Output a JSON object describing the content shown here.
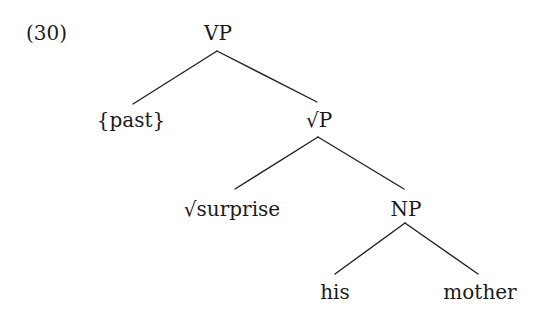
{
  "example_number": "(30)",
  "tree": {
    "nodes": [
      {
        "id": "vp",
        "label": "VP",
        "x": 218,
        "y": 23
      },
      {
        "id": "past",
        "label": "{past}",
        "x": 131,
        "y": 110
      },
      {
        "id": "rootp",
        "label": "√P",
        "x": 319,
        "y": 110
      },
      {
        "id": "surprise",
        "label": "√surprise",
        "x": 232,
        "y": 199
      },
      {
        "id": "np",
        "label": "NP",
        "x": 406,
        "y": 199
      },
      {
        "id": "his",
        "label": "his",
        "x": 335,
        "y": 282
      },
      {
        "id": "mother",
        "label": "mother",
        "x": 480,
        "y": 282
      }
    ],
    "edges": [
      {
        "from": "vp",
        "to": "past",
        "x1": 217,
        "y1": 51,
        "x2": 133,
        "y2": 104
      },
      {
        "from": "vp",
        "to": "rootp",
        "x1": 217,
        "y1": 51,
        "x2": 317,
        "y2": 102
      },
      {
        "from": "rootp",
        "to": "surprise",
        "x1": 318,
        "y1": 137,
        "x2": 235,
        "y2": 189
      },
      {
        "from": "rootp",
        "to": "np",
        "x1": 318,
        "y1": 137,
        "x2": 404,
        "y2": 189
      },
      {
        "from": "np",
        "to": "his",
        "x1": 405,
        "y1": 223,
        "x2": 335,
        "y2": 274
      },
      {
        "from": "np",
        "to": "mother",
        "x1": 405,
        "y1": 223,
        "x2": 478,
        "y2": 274
      }
    ]
  },
  "colors": {
    "text": "#1a1a1a",
    "line": "#222222",
    "background": "#ffffff"
  }
}
